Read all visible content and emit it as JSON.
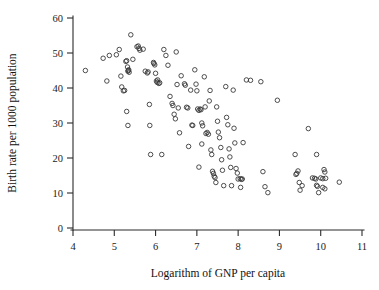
{
  "chart_data": {
    "type": "scatter",
    "title": "",
    "xlabel": "Logarithm of GNP per capita",
    "ylabel": "Birth rate per 1000 population",
    "xlim": [
      4,
      11
    ],
    "ylim": [
      0,
      60
    ],
    "xticks": [
      4,
      5,
      6,
      7,
      8,
      9,
      10,
      11
    ],
    "yticks": [
      0,
      10,
      20,
      30,
      40,
      50,
      60
    ],
    "xtick_labels": [
      "4",
      "5",
      "6",
      "7",
      "8",
      "9",
      "10",
      "11"
    ],
    "ytick_labels": [
      "0",
      "10",
      "20",
      "30",
      "40",
      "50",
      "60"
    ],
    "grid": false,
    "legend": null,
    "marker": "open-circle",
    "marker_color": "#3a3a3a",
    "n_points": 133,
    "points": [
      [
        4.3,
        45.0
      ],
      [
        4.73,
        48.5
      ],
      [
        4.88,
        49.3
      ],
      [
        4.82,
        42.0
      ],
      [
        5.05,
        49.5
      ],
      [
        5.12,
        51.0
      ],
      [
        5.16,
        43.4
      ],
      [
        5.18,
        40.3
      ],
      [
        5.22,
        39.2
      ],
      [
        5.25,
        39.3
      ],
      [
        5.28,
        47.6
      ],
      [
        5.3,
        47.8
      ],
      [
        5.32,
        46.0
      ],
      [
        5.33,
        44.8
      ],
      [
        5.35,
        45.2
      ],
      [
        5.36,
        44.5
      ],
      [
        5.34,
        45.0
      ],
      [
        5.3,
        33.3
      ],
      [
        5.33,
        29.3
      ],
      [
        5.4,
        55.2
      ],
      [
        5.45,
        48.2
      ],
      [
        5.55,
        51.8
      ],
      [
        5.58,
        52.0
      ],
      [
        5.6,
        51.3
      ],
      [
        5.62,
        50.8
      ],
      [
        5.7,
        51.1
      ],
      [
        5.75,
        44.8
      ],
      [
        5.8,
        44.3
      ],
      [
        5.82,
        44.6
      ],
      [
        5.85,
        35.3
      ],
      [
        5.86,
        29.3
      ],
      [
        5.88,
        21.0
      ],
      [
        5.95,
        47.3
      ],
      [
        5.96,
        47.0
      ],
      [
        5.98,
        46.6
      ],
      [
        6.0,
        44.2
      ],
      [
        6.02,
        42.0
      ],
      [
        6.04,
        41.6
      ],
      [
        6.05,
        42.3
      ],
      [
        6.08,
        41.3
      ],
      [
        6.1,
        41.5
      ],
      [
        6.15,
        21.0
      ],
      [
        6.2,
        51.0
      ],
      [
        6.25,
        49.3
      ],
      [
        6.3,
        46.5
      ],
      [
        6.35,
        37.6
      ],
      [
        6.4,
        35.6
      ],
      [
        6.42,
        35.0
      ],
      [
        6.45,
        32.5
      ],
      [
        6.48,
        31.2
      ],
      [
        6.5,
        50.3
      ],
      [
        6.52,
        41.0
      ],
      [
        6.55,
        34.3
      ],
      [
        6.58,
        27.2
      ],
      [
        6.62,
        43.5
      ],
      [
        6.7,
        41.2
      ],
      [
        6.72,
        40.8
      ],
      [
        6.75,
        34.5
      ],
      [
        6.78,
        34.3
      ],
      [
        6.8,
        23.3
      ],
      [
        6.85,
        39.4
      ],
      [
        6.88,
        29.4
      ],
      [
        6.9,
        29.3
      ],
      [
        6.95,
        45.2
      ],
      [
        6.98,
        41.1
      ],
      [
        7.0,
        39.2
      ],
      [
        7.02,
        34.0
      ],
      [
        7.05,
        33.6
      ],
      [
        7.08,
        34.0
      ],
      [
        7.1,
        33.8
      ],
      [
        7.12,
        30.0
      ],
      [
        7.14,
        29.2
      ],
      [
        7.05,
        17.4
      ],
      [
        7.12,
        24.0
      ],
      [
        7.18,
        43.2
      ],
      [
        7.2,
        34.6
      ],
      [
        7.22,
        27.0
      ],
      [
        7.25,
        27.3
      ],
      [
        7.28,
        26.8
      ],
      [
        7.3,
        36.3
      ],
      [
        7.32,
        39.3
      ],
      [
        7.34,
        22.3
      ],
      [
        7.36,
        21.0
      ],
      [
        7.38,
        16.2
      ],
      [
        7.4,
        15.6
      ],
      [
        7.42,
        14.8
      ],
      [
        7.44,
        14.4
      ],
      [
        7.46,
        13.0
      ],
      [
        7.48,
        34.6
      ],
      [
        7.5,
        30.5
      ],
      [
        7.52,
        27.4
      ],
      [
        7.55,
        25.8
      ],
      [
        7.58,
        23.0
      ],
      [
        7.6,
        19.5
      ],
      [
        7.62,
        16.5
      ],
      [
        7.65,
        12.1
      ],
      [
        7.7,
        40.4
      ],
      [
        7.72,
        31.6
      ],
      [
        7.75,
        29.5
      ],
      [
        7.78,
        22.6
      ],
      [
        7.8,
        20.3
      ],
      [
        7.82,
        17.3
      ],
      [
        7.84,
        12.1
      ],
      [
        7.88,
        39.4
      ],
      [
        7.9,
        28.5
      ],
      [
        7.92,
        24.3
      ],
      [
        7.95,
        17.0
      ],
      [
        7.98,
        15.7
      ],
      [
        8.0,
        14.0
      ],
      [
        8.05,
        14.1
      ],
      [
        8.08,
        13.9
      ],
      [
        8.1,
        14.0
      ],
      [
        8.06,
        11.6
      ],
      [
        8.12,
        24.4
      ],
      [
        8.2,
        42.3
      ],
      [
        8.3,
        42.2
      ],
      [
        8.55,
        41.8
      ],
      [
        8.6,
        16.1
      ],
      [
        8.65,
        11.8
      ],
      [
        8.72,
        10.1
      ],
      [
        8.95,
        36.5
      ],
      [
        9.38,
        21.0
      ],
      [
        9.4,
        15.3
      ],
      [
        9.42,
        15.6
      ],
      [
        9.45,
        16.3
      ],
      [
        9.48,
        13.0
      ],
      [
        9.5,
        10.8
      ],
      [
        9.55,
        12.1
      ],
      [
        9.7,
        28.4
      ],
      [
        9.9,
        21.0
      ],
      [
        9.8,
        14.3
      ],
      [
        9.85,
        14.2
      ],
      [
        9.88,
        14.0
      ],
      [
        9.9,
        12.2
      ],
      [
        9.92,
        11.9
      ],
      [
        9.95,
        10.1
      ],
      [
        10.0,
        14.3
      ],
      [
        10.05,
        14.1
      ],
      [
        10.08,
        16.7
      ],
      [
        10.1,
        16.0
      ],
      [
        10.12,
        14.2
      ],
      [
        10.05,
        11.6
      ],
      [
        10.1,
        11.2
      ],
      [
        10.45,
        13.1
      ]
    ]
  },
  "axes": {
    "x_title": "Logarithm of GNP per capita",
    "y_title": "Birth rate per 1000 population"
  }
}
